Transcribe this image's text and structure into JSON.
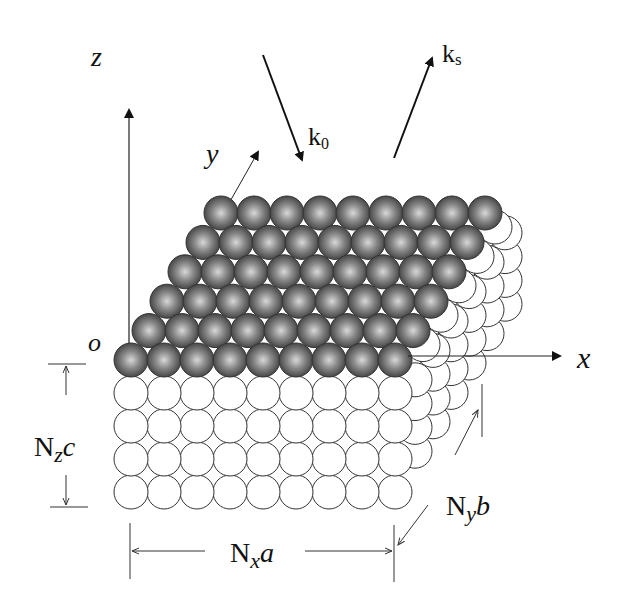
{
  "diagram": {
    "type": "crystal-lattice-schematic",
    "axes": {
      "z": {
        "label": "z"
      },
      "y": {
        "label": "y"
      },
      "x": {
        "label": "x"
      },
      "origin": {
        "label": "o"
      }
    },
    "vectors": {
      "incident": {
        "label_main": "k",
        "label_sub": "0"
      },
      "scattered": {
        "label_main": "k",
        "label_sub": "s"
      }
    },
    "dimensions": {
      "height": {
        "main": "N",
        "sub": "z",
        "tail": "c"
      },
      "depth": {
        "main": "N",
        "sub": "y",
        "tail": "b"
      },
      "width": {
        "main": "N",
        "sub": "x",
        "tail": "a"
      }
    },
    "lattice": {
      "surface_rows": 6,
      "atoms_per_row": 9,
      "bulk_layers_front": 4,
      "surface_color": "#555555",
      "bulk_color": "#ffffff"
    }
  }
}
